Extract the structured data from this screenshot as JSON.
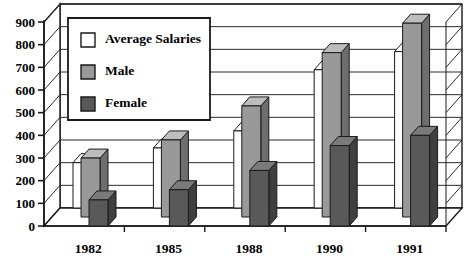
{
  "chart_data": {
    "type": "bar",
    "title": "",
    "subtitle": "",
    "xlabel": "",
    "ylabel": "",
    "categories": [
      "1982",
      "1985",
      "1988",
      "1990",
      "1991"
    ],
    "series": [
      {
        "name": "Average Salaries",
        "values": [
          200,
          265,
          340,
          610,
          690
        ],
        "color": "#ffffff"
      },
      {
        "name": "Male",
        "values": [
          260,
          340,
          490,
          725,
          855
        ],
        "color": "#999999"
      },
      {
        "name": "Female",
        "values": [
          115,
          160,
          245,
          355,
          400
        ],
        "color": "#595959"
      }
    ],
    "ylim": [
      0,
      900
    ],
    "yticks": [
      0,
      100,
      200,
      300,
      400,
      500,
      600,
      700,
      800,
      900
    ],
    "ytick_labels": [
      "0",
      "100",
      "200",
      "300",
      "400",
      "500",
      "600",
      "700",
      "800",
      "900"
    ],
    "grid": true,
    "legend_position": "upper-left",
    "style": "3d-bar"
  },
  "legend": {
    "entries": [
      {
        "label": "Average Salaries",
        "swatch": "#ffffff"
      },
      {
        "label": "Male",
        "swatch": "#999999"
      },
      {
        "label": "Female",
        "swatch": "#595959"
      }
    ]
  },
  "colors": {
    "axis": "#1a1a1a",
    "grid": "#2b2b2b",
    "wall": "#ffffff",
    "average": "#ffffff",
    "male": "#999999",
    "female": "#595959",
    "bar_top_light": "#bdbdbd",
    "bar_side_dark": "#6e6e6e",
    "female_top": "#7a7a7a",
    "female_side": "#3f3f3f"
  }
}
